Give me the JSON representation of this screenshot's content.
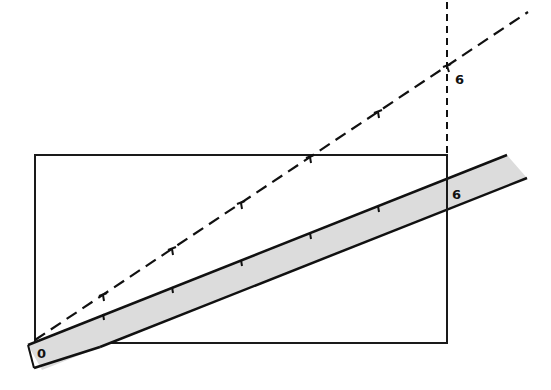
{
  "diagram": {
    "colors": {
      "ink": "#111111",
      "ruler_fill": "#dcdcdc",
      "background": "#ffffff"
    },
    "rectangle": {
      "x": 35,
      "y": 155,
      "width": 412,
      "height": 188
    },
    "ruler": {
      "start_label": "0",
      "end_label": "6",
      "divisions": 6
    },
    "projection_line": {
      "style": "dashed",
      "end_label": "6",
      "divisions": 6
    },
    "vertical_guide": {
      "style": "dashed",
      "x": 447
    },
    "labels": {
      "ruler_zero": "0",
      "ruler_six": "6",
      "projection_six": "6"
    }
  }
}
